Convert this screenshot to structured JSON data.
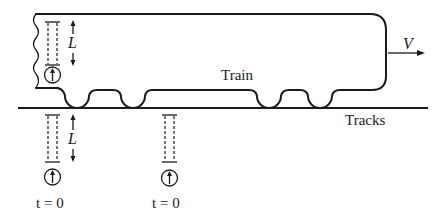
{
  "diagram": {
    "labels": {
      "train": "Train",
      "tracks": "Tracks",
      "velocity": "V",
      "length": "L"
    },
    "clocks": [
      {
        "position": "on-train",
        "length_label": "L"
      },
      {
        "position": "ground-left",
        "length_label": "L",
        "time_label": "t = 0"
      },
      {
        "position": "ground-right",
        "time_label": "t = 0"
      }
    ],
    "time_labels": [
      "t = 0",
      "t = 0"
    ],
    "colors": {
      "ink": "#1a1a1a",
      "background": "#ffffff"
    }
  }
}
